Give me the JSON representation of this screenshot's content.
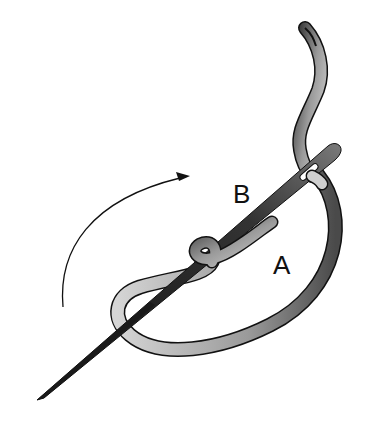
{
  "illustration": {
    "subject": "needle with ribbon thread wrapped around it",
    "labels": {
      "b": "B",
      "a": "A"
    },
    "arrow": {
      "direction": "clockwise-curve-pointing-right"
    },
    "colors": {
      "background": "#ffffff",
      "needle_dark": "#2a2a2a",
      "needle_light": "#8a8a8a",
      "ribbon_dark": "#3a3a3a",
      "ribbon_light": "#cfcfcf",
      "outline": "#111111"
    }
  }
}
